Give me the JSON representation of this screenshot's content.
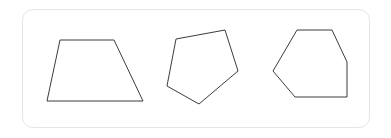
{
  "canvas": {
    "width": 391,
    "height": 138,
    "background_color": "#ffffff"
  },
  "card": {
    "name": "shape-panel",
    "background_color": "#ffffff",
    "border_color": "#e3e5e7",
    "border_radius": 11,
    "x": 22,
    "y": 9,
    "width": 348,
    "height": 119
  },
  "drawing": {
    "stroke_color": "#3c3c3c",
    "fill_color": "#ffffff",
    "stroke_width": 1,
    "shape_count": 3,
    "shapes": [
      {
        "name": "trapezoid",
        "sides": 4,
        "points": "60,40 114,40 143,101 47,101"
      },
      {
        "name": "pentagon",
        "sides": 5,
        "points": "225,30 238,71 199,104 167,86 176,39"
      },
      {
        "name": "hexagon",
        "sides": 6,
        "points": "297,30 332,30 347,62 347,97 295,97 273,71"
      }
    ]
  }
}
